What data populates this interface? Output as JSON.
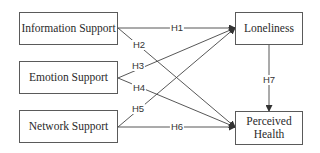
{
  "diagram": {
    "nodes": [
      {
        "id": "info",
        "label": "Information Support",
        "x": 19,
        "y": 12,
        "w": 99,
        "h": 33
      },
      {
        "id": "emotion",
        "label": "Emotion Support",
        "x": 19,
        "y": 61,
        "w": 99,
        "h": 33
      },
      {
        "id": "network",
        "label": "Network Support",
        "x": 19,
        "y": 110,
        "w": 99,
        "h": 33
      },
      {
        "id": "loneliness",
        "label": "Loneliness",
        "x": 235,
        "y": 12,
        "w": 68,
        "h": 33
      },
      {
        "id": "health",
        "label": "Perceived Health",
        "x": 235,
        "y": 111,
        "w": 68,
        "h": 34
      }
    ],
    "edges": [
      {
        "id": "H1",
        "label": "H1",
        "from": "info",
        "to": "loneliness"
      },
      {
        "id": "H2",
        "label": "H2",
        "from": "info",
        "to": "health"
      },
      {
        "id": "H3",
        "label": "H3",
        "from": "emotion",
        "to": "loneliness"
      },
      {
        "id": "H4",
        "label": "H4",
        "from": "emotion",
        "to": "health"
      },
      {
        "id": "H5",
        "label": "H5",
        "from": "network",
        "to": "loneliness"
      },
      {
        "id": "H6",
        "label": "H6",
        "from": "network",
        "to": "health"
      },
      {
        "id": "H7",
        "label": "H7",
        "from": "loneliness",
        "to": "health"
      }
    ],
    "line_color": "#444444",
    "border_color": "#5a5a5a"
  },
  "labels": {
    "info": "Information Support",
    "emotion": "Emotion Support",
    "network": "Network Support",
    "loneliness": "Loneliness",
    "health_line1": "Perceived",
    "health_line2": "Health",
    "H1": "H1",
    "H2": "H2",
    "H3": "H3",
    "H4": "H4",
    "H5": "H5",
    "H6": "H6",
    "H7": "H7"
  }
}
